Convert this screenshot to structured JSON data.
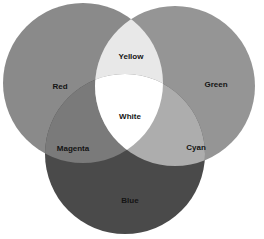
{
  "diagram": {
    "title": "",
    "circles": [
      {
        "name": "Red",
        "cx": 83,
        "cy": 83,
        "r": 80,
        "fill": "#8a8a8a"
      },
      {
        "name": "Green",
        "cx": 175,
        "cy": 86,
        "r": 80,
        "fill": "#959595"
      },
      {
        "name": "Blue",
        "cx": 125,
        "cy": 154,
        "r": 80,
        "fill": "#4a4a4a"
      }
    ],
    "regions": {
      "yellow": {
        "fill": "#e8e8e8"
      },
      "white": {
        "fill": "#ffffff"
      },
      "magenta": {
        "fill": "#7a7a7a"
      },
      "cyan": {
        "fill": "#adadad"
      }
    },
    "labels": {
      "red": "Red",
      "green": "Green",
      "blue": "Blue",
      "yellow": "Yellow",
      "magenta": "Magenta",
      "cyan": "Cyan",
      "white": "White"
    }
  }
}
